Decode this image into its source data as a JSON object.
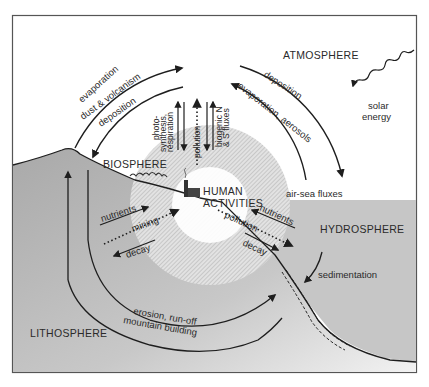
{
  "diagram": {
    "title": "",
    "type": "biogeochemical cycle schematic",
    "colors": {
      "background": "#ffffff",
      "frame": "#555555",
      "lithosphere_fill": "#b8b8b8",
      "hydrosphere_fill": "#c4c4c4",
      "human_zone_hatch": "#cfcfcf",
      "line": "#1e1e1e"
    },
    "reservoirs": {
      "atmosphere": "ATMOSPHERE",
      "biosphere": "BIOSPHERE",
      "hydrosphere": "HYDROSPHERE",
      "lithosphere": "LITHOSPHERE",
      "human": [
        "HUMAN",
        "ACTIVITIES"
      ]
    },
    "fluxes": {
      "litho_to_atmo_1": "evaporation",
      "litho_to_atmo_2": "dust & volcanism",
      "atmo_to_bio": "deposition",
      "bio_atmo_1": "photo-",
      "bio_atmo_2": "synthesis,",
      "bio_atmo_3": "respiration",
      "human_to_atmo": "pollution",
      "biogenic_1": "biogenic N",
      "biogenic_2": "& S fluxes",
      "atmo_to_hydro": "deposition",
      "hydro_to_atmo": "evaporation, aerosols",
      "air_sea": "air-sea fluxes",
      "solar": [
        "solar",
        "energy"
      ],
      "bio_litho_in": "nutrients",
      "human_to_litho": "mining",
      "bio_litho_out": "decay",
      "hydro_bio_in": "nutrients",
      "human_to_hydro": "pollution",
      "hydro_bio_out": "decay",
      "sedimentation": "sedimentation",
      "erosion": "erosion, run-off",
      "mountain": "mountain building"
    }
  }
}
